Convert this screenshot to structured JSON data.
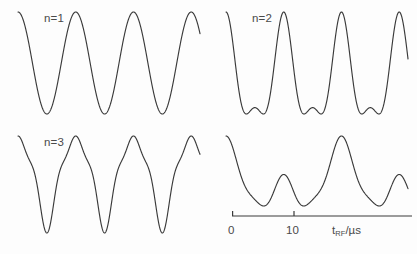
{
  "figure": {
    "background_color": "#fdfdfd",
    "curve_color": "#3a3a3a",
    "text_color": "#4a4a4a",
    "panel_count": 4,
    "layout": "2x2 grid"
  },
  "panels": [
    {
      "id": "panel-n1",
      "label": "n=1",
      "label_visible": true
    },
    {
      "id": "panel-n2",
      "label": "n=2",
      "label_visible": true
    },
    {
      "id": "panel-n3",
      "label": "n=3",
      "label_visible": true
    },
    {
      "id": "panel-n4",
      "label": "",
      "label_visible": false
    }
  ],
  "axis": {
    "title_symbol": "t",
    "title_subscript": "RF",
    "title_unit": "/µs",
    "ticks": [
      {
        "value": 0,
        "label": "0",
        "position_us": 0
      },
      {
        "value": 10,
        "label": "10",
        "position_us": 10
      }
    ],
    "range_us": [
      0,
      29
    ],
    "line_length_px": 180
  },
  "chart_data": {
    "type": "line",
    "title": "",
    "xlabel": "t_RF/µs",
    "ylabel": "",
    "xlim": [
      0,
      29
    ],
    "grid": false,
    "legend": "none",
    "series": [
      {
        "name": "n=1",
        "panel": "panel-n1",
        "description": "Sinusoidal Rabi oscillation, single frequency",
        "period_us": 9.2,
        "peaks_us": [
          0.0,
          9.2,
          18.4,
          27.6
        ],
        "troughs_us": [
          4.6,
          13.8,
          23.0
        ],
        "harmonics": [
          {
            "order": 1,
            "amplitude": 1.0,
            "phase": 0.0
          }
        ],
        "offset": 0.0
      },
      {
        "name": "n=2",
        "panel": "panel-n2",
        "description": "Two-photon oscillation: tall main peak with a small secondary bump between deep troughs",
        "period_us": 9.2,
        "peaks_us": [
          0.0,
          9.2,
          18.4,
          27.6
        ],
        "secondary_peaks_us": [
          4.6,
          13.8,
          23.0
        ],
        "troughs_us": [
          2.3,
          6.9,
          11.5,
          16.1,
          20.7,
          25.3
        ],
        "harmonics": [
          {
            "order": 1,
            "amplitude": 0.72,
            "phase": 0.0
          },
          {
            "order": 2,
            "amplitude": 0.3,
            "phase": 0.0
          }
        ],
        "offset": 0.0
      },
      {
        "name": "n=3",
        "panel": "panel-n3",
        "description": "Three-photon oscillation: narrow peaks with shoulder inflections on the flanks and sharp V troughs",
        "period_us": 9.2,
        "peaks_us": [
          0.0,
          9.2,
          18.4,
          27.6
        ],
        "troughs_us": [
          4.6,
          13.8,
          23.0
        ],
        "harmonics": [
          {
            "order": 1,
            "amplitude": 0.8,
            "phase": 0.0
          },
          {
            "order": 2,
            "amplitude": 0.17,
            "phase": 3.14159
          },
          {
            "order": 3,
            "amplitude": 0.12,
            "phase": 0.0
          }
        ],
        "offset": 0.0
      },
      {
        "name": "n=4",
        "panel": "panel-n4",
        "description": "Unlabeled fourth trace: tall peak alternating with a lower broad bump, deep troughs between",
        "period_us": 18.4,
        "peaks_us": [
          0.0,
          13.0,
          29.0
        ],
        "secondary_peaks_us": [
          6.6,
          24.0
        ],
        "troughs_us": [
          3.6,
          9.8,
          18.6,
          26.4
        ],
        "harmonics": [
          {
            "order": 1,
            "amplitude": 0.52,
            "phase": 0.0
          },
          {
            "order": 2,
            "amplitude": 0.6,
            "phase": 0.0
          },
          {
            "order": 4,
            "amplitude": 0.14,
            "phase": 0.0
          }
        ],
        "offset": 0.0
      }
    ]
  }
}
